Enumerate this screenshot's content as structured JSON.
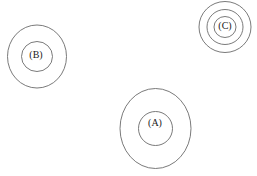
{
  "figure": {
    "background_color": "#ffffff",
    "stroke_color": "#6b6b6b",
    "label_color": "#1a1a1a",
    "width": 257,
    "height": 176,
    "groups": [
      {
        "id": "group-b",
        "label": "(B)",
        "label_x": 36,
        "label_y": 56,
        "center_x": 37,
        "center_y": 56.5,
        "rings": [
          {
            "rx": 29.5,
            "ry": 31.5,
            "stroke_width": 0.9
          },
          {
            "rx": 15.5,
            "ry": 15.0,
            "stroke_width": 0.9
          }
        ]
      },
      {
        "id": "group-c",
        "label": "(C)",
        "label_x": 225,
        "label_y": 27,
        "center_x": 225,
        "center_y": 27,
        "rings": [
          {
            "rx": 26.0,
            "ry": 25.5,
            "stroke_width": 0.9
          },
          {
            "rx": 18.0,
            "ry": 17.5,
            "stroke_width": 0.9
          },
          {
            "rx": 11.0,
            "ry": 10.5,
            "stroke_width": 0.9
          }
        ]
      },
      {
        "id": "group-a",
        "label": "(A)",
        "label_x": 155,
        "label_y": 124,
        "center_x": 155.5,
        "center_y": 128.5,
        "rings": [
          {
            "rx": 35.5,
            "ry": 40.0,
            "stroke_width": 0.9
          },
          {
            "rx": 17.0,
            "ry": 17.0,
            "stroke_width": 0.9
          }
        ]
      }
    ]
  }
}
